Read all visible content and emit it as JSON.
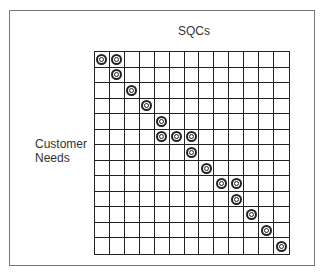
{
  "diagram": {
    "column_header": "SQCs",
    "row_header_line1": "Customer",
    "row_header_line2": "Needs",
    "rows": 13,
    "cols": 13,
    "symbol": "strong-relationship-double-circle",
    "marks": [
      [
        0,
        0
      ],
      [
        0,
        1
      ],
      [
        1,
        1
      ],
      [
        2,
        2
      ],
      [
        3,
        3
      ],
      [
        4,
        4
      ],
      [
        5,
        4
      ],
      [
        5,
        5
      ],
      [
        5,
        6
      ],
      [
        6,
        6
      ],
      [
        7,
        7
      ],
      [
        8,
        8
      ],
      [
        8,
        9
      ],
      [
        9,
        9
      ],
      [
        10,
        10
      ],
      [
        11,
        11
      ],
      [
        12,
        12
      ]
    ]
  }
}
